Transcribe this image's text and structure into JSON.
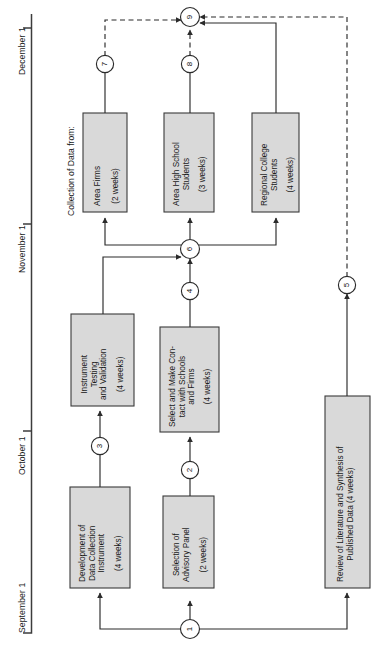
{
  "figure": {
    "type": "pert-network-diagram",
    "orientation": "rotated-90-ccw",
    "group_label": "Collection of Data from:"
  },
  "timeline": {
    "name": "project-timeline-axis",
    "ticks": [
      {
        "label": "September 1",
        "y": 633
      },
      {
        "label": "October 1",
        "y": 431
      },
      {
        "label": "November 1",
        "y": 224
      },
      {
        "label": "December 1",
        "y": 28
      }
    ]
  },
  "tasks": [
    {
      "id": "development-of-data-collection-instrument",
      "lines": [
        "Development of",
        "Data Collection",
        "Instrument"
      ],
      "duration": "(4 weeks)"
    },
    {
      "id": "selection-of-advisory-panel",
      "lines": [
        "Selection of",
        "Advisory Panel"
      ],
      "duration": "(2 weeks)"
    },
    {
      "id": "review-of-literature-and-synthesis-of-published-data",
      "lines": [
        "Review of Literature and Synthesis of",
        "Published Data (4 weeks)"
      ],
      "duration": ""
    },
    {
      "id": "instrument-testing-and-validation",
      "lines": [
        "Instrument",
        "Testing",
        "and Validation"
      ],
      "duration": "(4 weeks)"
    },
    {
      "id": "select-and-make-contact-with-schools-and-firms",
      "lines": [
        "Select and Make Con-",
        "tact with Schools",
        "and Firms"
      ],
      "duration": "(4 weeks)"
    },
    {
      "id": "area-firms",
      "lines": [
        "Area Firms"
      ],
      "duration": "(2 weeks)"
    },
    {
      "id": "area-high-school-students",
      "lines": [
        "Area High School",
        "Students"
      ],
      "duration": "(3 weeks)"
    },
    {
      "id": "regional-college-students",
      "lines": [
        "Regional College",
        "Students"
      ],
      "duration": "(4 weeks)"
    }
  ],
  "nodes": [
    {
      "id": "node-1",
      "label": "1"
    },
    {
      "id": "node-2",
      "label": "2"
    },
    {
      "id": "node-3",
      "label": "3"
    },
    {
      "id": "node-4",
      "label": "4"
    },
    {
      "id": "node-5",
      "label": "5"
    },
    {
      "id": "node-6",
      "label": "6"
    },
    {
      "id": "node-7",
      "label": "7"
    },
    {
      "id": "node-8",
      "label": "8"
    },
    {
      "id": "node-9",
      "label": "9"
    }
  ],
  "colors": {
    "box_fill": "#d9d9d9",
    "box_stroke": "#3a3a3a",
    "line": "#2b2b2b",
    "axis": "#3c3c3c",
    "text": "#1a1a1a",
    "page": "#ffffff"
  }
}
